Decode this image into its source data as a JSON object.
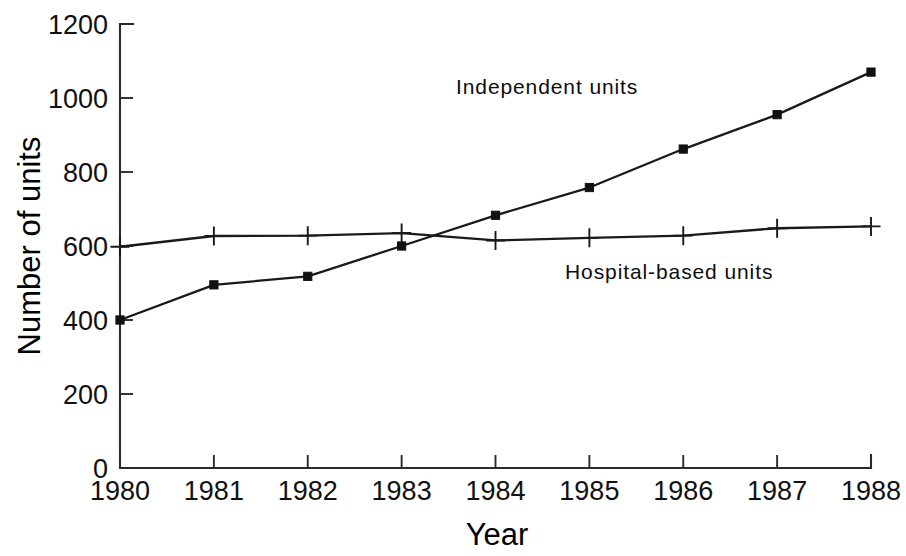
{
  "chart_data": {
    "type": "line",
    "title": "",
    "subtitle": "",
    "xlabel": "Year",
    "ylabel": "Number of units",
    "x": [
      1980,
      1981,
      1982,
      1983,
      1984,
      1985,
      1986,
      1987,
      1988
    ],
    "xtick_labels": [
      "1980",
      "1981",
      "1982",
      "1983",
      "1984",
      "1985",
      "1986",
      "1987",
      "1988"
    ],
    "ytick_labels": [
      "0",
      "200",
      "400",
      "600",
      "800",
      "1000",
      "1200"
    ],
    "yticks": [
      0,
      200,
      400,
      600,
      800,
      1000,
      1200
    ],
    "xlim": [
      1980,
      1988
    ],
    "ylim": [
      0,
      1200
    ],
    "grid": false,
    "legend_position": "inline-annotations",
    "series": [
      {
        "name": "Independent units",
        "marker": "square",
        "color": "#111111",
        "values": [
          400,
          495,
          518,
          600,
          683,
          758,
          862,
          955,
          1070
        ],
        "annotation": {
          "text": "Independent units",
          "x": 1984.55,
          "y": 1010
        }
      },
      {
        "name": "Hospital-based units",
        "marker": "plus",
        "color": "#1a1a1a",
        "values": [
          598,
          627,
          628,
          635,
          615,
          622,
          628,
          648,
          653
        ],
        "annotation": {
          "text": "Hospital-based units",
          "y": 510,
          "x": 1985.85
        }
      }
    ]
  },
  "axes": {
    "y_title": "Number of units",
    "x_title": "Year"
  }
}
